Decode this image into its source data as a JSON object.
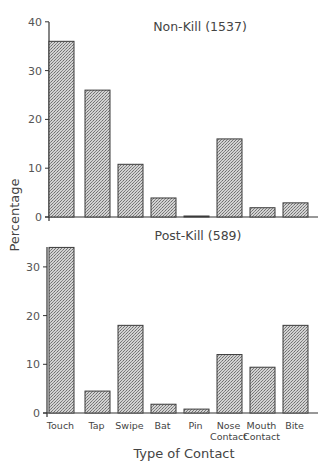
{
  "figure": {
    "ylabel": "Percentage",
    "xlabel": "Type of Contact",
    "colors": {
      "bar_fill": "#b8b8b8",
      "bar_stroke": "#3a3a3a",
      "axis": "#333333",
      "text": "#444444"
    }
  },
  "chart_data": [
    {
      "type": "bar",
      "title": "Non-Kill (1537)",
      "categories": [
        "Touch",
        "Tap",
        "Swipe",
        "Bat",
        "Pin",
        "Nose Contact",
        "Mouth Contact",
        "Bite"
      ],
      "values": [
        36,
        26,
        10.8,
        3.9,
        0.2,
        16,
        1.9,
        2.9
      ],
      "xlabel": "Type of Contact",
      "ylabel": "Percentage",
      "ylim": [
        0,
        40
      ],
      "yticks": [
        0,
        10,
        20,
        30,
        40
      ],
      "grid": false
    },
    {
      "type": "bar",
      "title": "Post-Kill (589)",
      "categories": [
        "Touch",
        "Tap",
        "Swipe",
        "Bat",
        "Pin",
        "Nose Contact",
        "Mouth Contact",
        "Bite"
      ],
      "values": [
        34,
        4.5,
        18,
        1.8,
        0.8,
        12,
        9.4,
        18
      ],
      "xlabel": "Type of Contact",
      "ylabel": "Percentage",
      "ylim": [
        0,
        35
      ],
      "yticks": [
        0,
        10,
        20,
        30
      ],
      "grid": false
    }
  ],
  "category_labels": [
    [
      "Touch"
    ],
    [
      "Tap"
    ],
    [
      "Swipe"
    ],
    [
      "Bat"
    ],
    [
      "Pin"
    ],
    [
      "Nose",
      "Contact"
    ],
    [
      "Mouth",
      "Contact"
    ],
    [
      "Bite"
    ]
  ]
}
